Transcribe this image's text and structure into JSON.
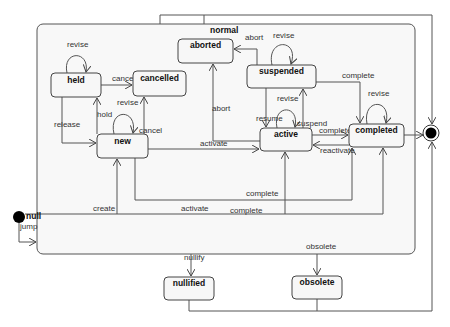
{
  "diagram": {
    "type": "state-machine",
    "composite_state": {
      "name": "normal"
    },
    "states": {
      "held": "held",
      "cancelled": "cancelled",
      "new": "new",
      "aborted": "aborted",
      "suspended": "suspended",
      "active": "active",
      "completed": "completed",
      "nullified": "nullified",
      "obsolete": "obsolete"
    },
    "initial_state": {
      "label": "null"
    },
    "final_state": {
      "label": ""
    },
    "transitions": {
      "held_revise": "revise",
      "held_cancel": "cancel",
      "held_release": "release",
      "new_hold": "hold",
      "new_revise": "revise",
      "new_cancel": "cancel",
      "new_activate": "activate",
      "new_complete": "complete",
      "null_create": "create",
      "null_activate": "activate",
      "null_complete": "complete",
      "null_jump": "jump",
      "suspended_revise": "revise",
      "suspended_abort": "abort",
      "suspended_resume": "resume",
      "suspended_complete": "complete",
      "active_suspend": "suspend",
      "active_revise": "revise",
      "active_abort": "abort",
      "active_complete": "complete",
      "completed_reactivate": "reactivate",
      "completed_revise": "revise",
      "normal_nullify": "nullify",
      "normal_obsolete": "obsolete"
    }
  }
}
